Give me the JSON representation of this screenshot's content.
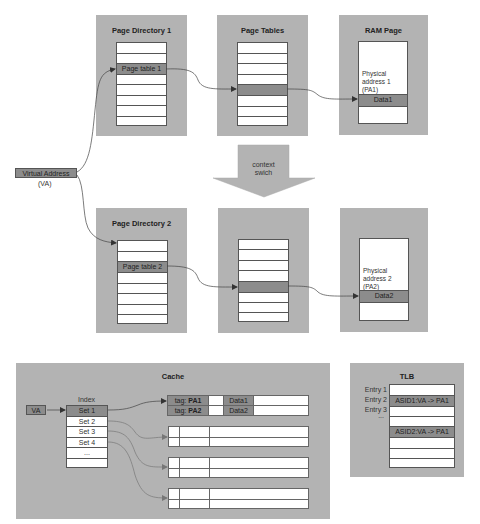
{
  "colors": {
    "panel_bg": "#b3b3b3",
    "highlight": "#8c8c8c",
    "table_bg": "#ffffff",
    "line": "#555555"
  },
  "top_row": {
    "page_directory": {
      "title": "Page Directory 1",
      "rows": [
        "",
        "",
        "Page table 1",
        "",
        "",
        "",
        "",
        ""
      ],
      "highlight_index": 2
    },
    "page_tables": {
      "title": "Page Tables",
      "rows": [
        "",
        "",
        "",
        "",
        "",
        "",
        "",
        ""
      ],
      "highlight_index": 4
    },
    "ram_page": {
      "title": "RAM Page",
      "address_label": [
        "Physical",
        "address 1",
        "(PA1)"
      ],
      "data_label": "Data1"
    }
  },
  "virtual_address": {
    "label": "Virtual Address",
    "abbr": "(VA)"
  },
  "context_switch": {
    "line1": "context",
    "line2": "swich"
  },
  "bottom_row": {
    "page_directory": {
      "title": "Page Directory 2",
      "rows": [
        "",
        "",
        "Page table 2",
        "",
        "",
        "",
        "",
        ""
      ],
      "highlight_index": 2
    },
    "page_tables": {
      "title": "",
      "rows": [
        "",
        "",
        "",
        "",
        "",
        "",
        "",
        ""
      ],
      "highlight_index": 4
    },
    "ram_page": {
      "title": "",
      "address_label": [
        "Physical",
        "address 2",
        "(PA2)"
      ],
      "data_label": "Data2"
    }
  },
  "cache": {
    "title": "Cache",
    "va_label": "VA",
    "index_header": "Index",
    "index_rows": [
      "Set 1",
      "Set 2",
      "Set 3",
      "Set 4",
      "...",
      ""
    ],
    "set1_lines": [
      {
        "tag_prefix": "tag: ",
        "tag": "PA1",
        "data": "Data1"
      },
      {
        "tag_prefix": "tag: ",
        "tag": "PA2",
        "data": "Data2"
      }
    ]
  },
  "tlb": {
    "title": "TLB",
    "entry_labels": [
      "Entry 1",
      "Entry 2",
      "Entry 3",
      "..."
    ],
    "rows": [
      "",
      "ASID1:VA -> PA1",
      "",
      "",
      "ASID2:VA -> PA1",
      "",
      "",
      ""
    ],
    "highlight_indices": [
      1,
      4
    ]
  }
}
